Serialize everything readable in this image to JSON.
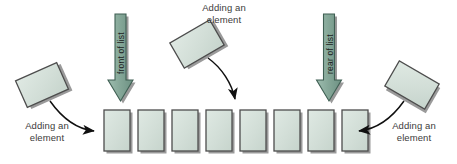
{
  "diagram": {
    "background_color": "#ffffff",
    "palette": {
      "element_fill": "#cfdcd4",
      "element_fill_light": "#dfe9e3",
      "element_stroke": "#4d4d4d",
      "shadow": "#9a9a9a",
      "arrow_fill": "#7fa394",
      "arrow_fill_light": "#9ebdaf",
      "arrow_stroke": "#3f5f53",
      "curve_stroke": "#101010",
      "caption_color": "#3b3b3b",
      "label_color": "#1d1d1d"
    },
    "list": {
      "name": "list-of-elements",
      "count": 8,
      "box_width": 26,
      "box_height": 41,
      "gap": 8,
      "start_x": 104,
      "top_y": 110
    },
    "pointers": [
      {
        "id": "front",
        "label": "front of list",
        "x": 120,
        "y_top": 12,
        "y_tip": 104
      },
      {
        "id": "rear",
        "label": "rear of list",
        "x": 329,
        "y_top": 12,
        "y_tip": 104
      }
    ],
    "captions": [
      {
        "id": "left",
        "text": "Adding an\nelement"
      },
      {
        "id": "middle",
        "text": "Adding an\nelement"
      },
      {
        "id": "right",
        "text": "Adding an\nelement"
      }
    ],
    "floating_elements": [
      {
        "id": "left-element",
        "rotation_deg": -24,
        "cx": 42,
        "cy": 85
      },
      {
        "id": "middle-element",
        "rotation_deg": -30,
        "cx": 197,
        "cy": 44
      },
      {
        "id": "right-element",
        "rotation_deg": 30,
        "cx": 412,
        "cy": 85
      }
    ],
    "insertion_arrows": [
      {
        "id": "left-insert-arrow",
        "from": "left-element",
        "to": "list-front"
      },
      {
        "id": "middle-insert-arrow",
        "from": "middle-element",
        "to": "list-middle"
      },
      {
        "id": "right-insert-arrow",
        "from": "right-element",
        "to": "list-rear"
      }
    ]
  }
}
